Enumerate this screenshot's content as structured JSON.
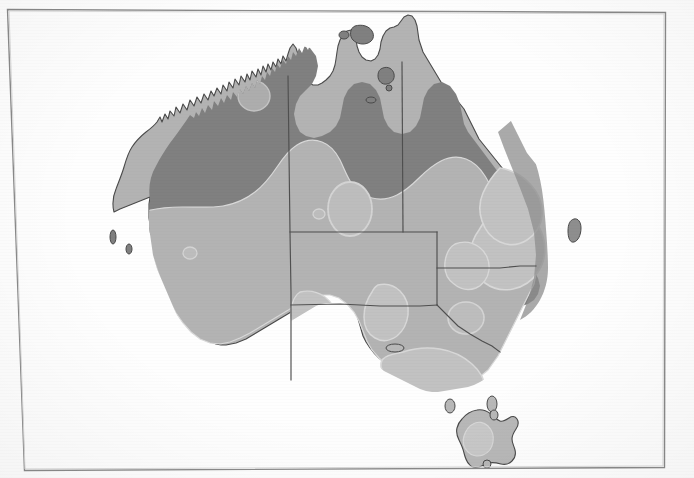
{
  "document": {
    "type": "map",
    "title": "Map of Australia with shaded distribution zones",
    "subject": "Australia",
    "has_text_labels": false,
    "has_legend": false,
    "background_color": "#fefefe",
    "frame": {
      "name": "page-border",
      "stroke_color": "#8a8a8a",
      "stroke_width": 1.4,
      "left": 7,
      "top": 9,
      "right": 666,
      "bottom": 468
    }
  },
  "palette": {
    "ocean": "#ffffff",
    "zone_dark": "#808080",
    "zone_mid": "#b3b3b3",
    "zone_light": "#c9c9c9",
    "zone_lightest": "#d4d4d4",
    "coast_outline": "#4a4a4a",
    "state_border": "#4f4f4f",
    "zone_edge": "#d9d9d9"
  },
  "map": {
    "name": "australia-map",
    "regions": [
      {
        "id": "zone-dark",
        "label": "Dark shading zone (northern and western coastal band)",
        "color": "#808080"
      },
      {
        "id": "zone-mid",
        "label": "Mid shading zone (interior)",
        "color": "#b3b3b3"
      },
      {
        "id": "zone-light",
        "label": "Light shading patches",
        "color": "#c9c9c9"
      }
    ],
    "state_boundaries": [
      {
        "id": "wa-nt-sa",
        "label": "Western Australia eastern border (vertical line)"
      },
      {
        "id": "nt-qld",
        "label": "Northern Territory / Queensland border (vertical line)"
      },
      {
        "id": "nt-sa",
        "label": "Northern Territory / South Australia border (horizontal line)"
      },
      {
        "id": "sa-qld-nsw",
        "label": "South Australia / Queensland / New South Wales borders"
      },
      {
        "id": "nsw-vic",
        "label": "New South Wales / Victoria border"
      }
    ],
    "islands": [
      {
        "id": "tasmania",
        "label": "Tasmania"
      },
      {
        "id": "king-island",
        "label": "King Island"
      },
      {
        "id": "flinders-island",
        "label": "Flinders Island"
      },
      {
        "id": "kangaroo-island",
        "label": "Kangaroo Island"
      },
      {
        "id": "melville-island",
        "label": "Melville Island"
      },
      {
        "id": "groote-eylandt",
        "label": "Groote Eylandt"
      },
      {
        "id": "fraser-island",
        "label": "Fraser Island"
      }
    ]
  }
}
